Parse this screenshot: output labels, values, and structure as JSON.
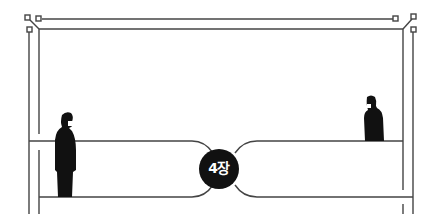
{
  "illustration": {
    "chapter_badge": {
      "label": "4장",
      "fill": "#111111",
      "text_color": "#ffffff"
    },
    "line_color": "#444444",
    "figure_color": "#111111",
    "figures": [
      {
        "name": "man-left",
        "description": "man in suit with face mask, standing, facing right"
      },
      {
        "name": "man-right",
        "description": "man in suit with face mask, standing, facing left"
      }
    ]
  }
}
